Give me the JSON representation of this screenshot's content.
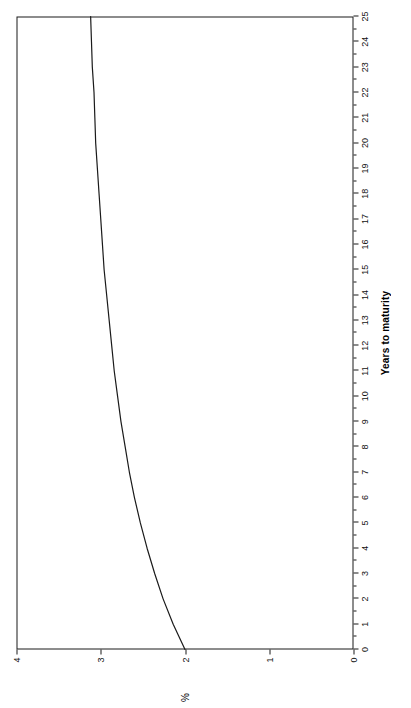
{
  "figure": {
    "orientation": "rotated-180",
    "background": "#ffffff",
    "line_color": "#1a1a1a",
    "axis_color": "#1a1a1a"
  },
  "chart_data": {
    "type": "line",
    "title": "",
    "xlabel": "Years to maturity",
    "ylabel": "%",
    "xlim": [
      0,
      25
    ],
    "ylim": [
      0,
      4
    ],
    "grid": false,
    "legend": null,
    "x_ticks": [
      0,
      1,
      2,
      3,
      4,
      5,
      6,
      7,
      8,
      9,
      10,
      11,
      12,
      13,
      14,
      15,
      16,
      17,
      18,
      19,
      20,
      21,
      22,
      23,
      24,
      25
    ],
    "x_tick_labels": [
      "0",
      "1",
      "2",
      "3",
      "4",
      "5",
      "6",
      "7",
      "8",
      "9",
      "10",
      "11",
      "12",
      "13",
      "14",
      "15",
      "16",
      "17",
      "18",
      "19",
      "20",
      "21",
      "22",
      "23",
      "24",
      "25"
    ],
    "y_ticks": [
      0,
      1,
      2,
      3,
      4
    ],
    "y_tick_labels": [
      "0",
      "1",
      "2",
      "3",
      "4"
    ],
    "series": [
      {
        "name": "Yield curve",
        "x": [
          0,
          1,
          2,
          3,
          4,
          5,
          6,
          7,
          8,
          9,
          10,
          11,
          12,
          13,
          14,
          15,
          16,
          17,
          18,
          19,
          20,
          21,
          22,
          23,
          24,
          25
        ],
        "values": [
          2.0,
          2.14,
          2.26,
          2.36,
          2.45,
          2.53,
          2.6,
          2.66,
          2.71,
          2.76,
          2.8,
          2.84,
          2.87,
          2.9,
          2.93,
          2.96,
          2.98,
          3.0,
          3.02,
          3.04,
          3.06,
          3.07,
          3.08,
          3.1,
          3.11,
          3.12
        ]
      }
    ]
  }
}
